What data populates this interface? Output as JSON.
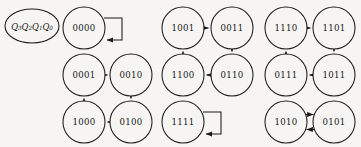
{
  "diagram": {
    "title_label": "Q3Q2Q1Q0",
    "legend": {
      "text_main": "Q",
      "subscripts": [
        "3",
        "2",
        "1",
        "0"
      ],
      "full": "Q₃Q₂Q₁Q₀"
    },
    "background_color": "#f6f5f3",
    "stroke_color": "#1b1b1b",
    "text_color": "#151515",
    "nodes": [
      {
        "id": "n0000",
        "label": "0000",
        "cx": 84,
        "cy": 28,
        "r": 21
      },
      {
        "id": "n0001",
        "label": "0001",
        "cx": 84,
        "cy": 75,
        "r": 21
      },
      {
        "id": "n0010",
        "label": "0010",
        "cx": 131,
        "cy": 75,
        "r": 21
      },
      {
        "id": "n1000",
        "label": "1000",
        "cx": 84,
        "cy": 122,
        "r": 21
      },
      {
        "id": "n0100",
        "label": "0100",
        "cx": 131,
        "cy": 122,
        "r": 21
      },
      {
        "id": "n1001",
        "label": "1001",
        "cx": 183,
        "cy": 28,
        "r": 21
      },
      {
        "id": "n0011",
        "label": "0011",
        "cx": 232,
        "cy": 28,
        "r": 21
      },
      {
        "id": "n1100",
        "label": "1100",
        "cx": 183,
        "cy": 75,
        "r": 21
      },
      {
        "id": "n0110",
        "label": "0110",
        "cx": 232,
        "cy": 75,
        "r": 21
      },
      {
        "id": "n1111",
        "label": "1111",
        "cx": 183,
        "cy": 122,
        "r": 21
      },
      {
        "id": "n1110",
        "label": "1110",
        "cx": 286,
        "cy": 28,
        "r": 21
      },
      {
        "id": "n1101",
        "label": "1101",
        "cx": 334,
        "cy": 28,
        "r": 21
      },
      {
        "id": "n0111",
        "label": "0111",
        "cx": 286,
        "cy": 75,
        "r": 21
      },
      {
        "id": "n1011",
        "label": "1011",
        "cx": 334,
        "cy": 75,
        "r": 21
      },
      {
        "id": "n1010",
        "label": "1010",
        "cx": 286,
        "cy": 122,
        "r": 21
      },
      {
        "id": "n0101",
        "label": "0101",
        "cx": 334,
        "cy": 122,
        "r": 21
      }
    ],
    "edges": [
      {
        "from": "0001",
        "to": "0010",
        "direction": "right"
      },
      {
        "from": "0010",
        "to": "0100",
        "direction": "down"
      },
      {
        "from": "0100",
        "to": "1000",
        "direction": "left"
      },
      {
        "from": "1000",
        "to": "0001",
        "direction": "up"
      },
      {
        "from": "1001",
        "to": "0011",
        "direction": "right"
      },
      {
        "from": "0011",
        "to": "0110",
        "direction": "down"
      },
      {
        "from": "0110",
        "to": "1100",
        "direction": "left"
      },
      {
        "from": "1100",
        "to": "1001",
        "direction": "up"
      },
      {
        "from": "1110",
        "to": "1101",
        "direction": "right"
      },
      {
        "from": "1101",
        "to": "1011",
        "direction": "down"
      },
      {
        "from": "1011",
        "to": "0111",
        "direction": "left"
      },
      {
        "from": "0111",
        "to": "1110",
        "direction": "up"
      },
      {
        "from": "1010",
        "to": "0101",
        "direction": "right"
      },
      {
        "from": "0101",
        "to": "1010",
        "direction": "left"
      }
    ],
    "self_loops": [
      {
        "node": "0000"
      },
      {
        "node": "1111"
      }
    ]
  }
}
